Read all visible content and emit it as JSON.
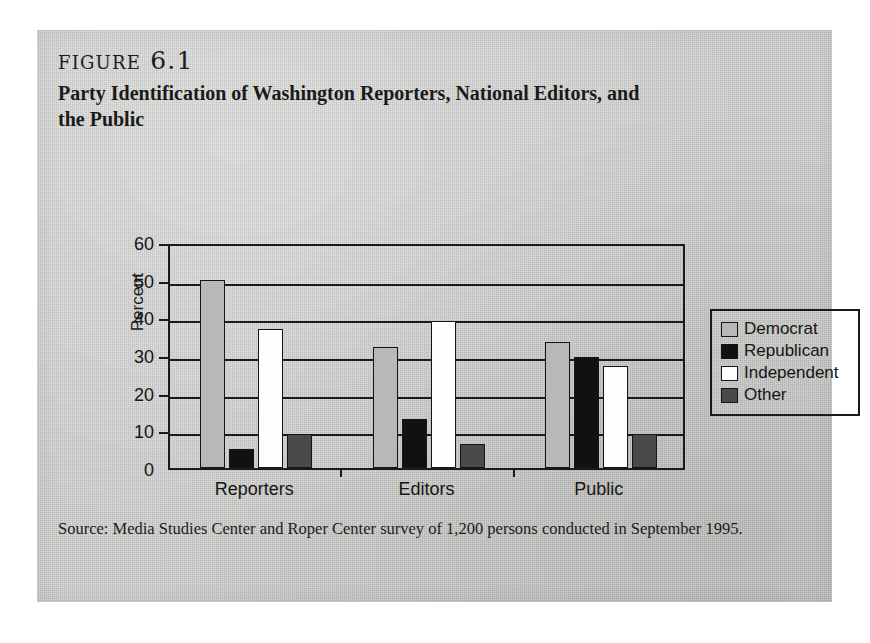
{
  "figure": {
    "number_label": "figure 6.1",
    "caption": "Party Identification of Washington Reporters, National Editors, and the Public",
    "source_note": "Source: Media Studies Center and Roper Center survey of 1,200 persons conducted in September 1995."
  },
  "colors": {
    "page_background": "#ffffff",
    "panel_background": "#c9c9c7",
    "ink": "#1a1a1a",
    "democrat": "#b8b8b6",
    "republican": "#111111",
    "independent": "#fdfdfb",
    "other": "#4a4a4a"
  },
  "chart_data": {
    "type": "bar",
    "title": "Party Identification of Washington Reporters, National Editors, and the Public",
    "xlabel": "",
    "ylabel": "Percent",
    "ylim": [
      0,
      60
    ],
    "yticks": [
      0,
      10,
      20,
      30,
      40,
      50,
      60
    ],
    "grid": true,
    "legend_position": "right",
    "categories": [
      "Reporters",
      "Editors",
      "Public"
    ],
    "series": [
      {
        "name": "Democrat",
        "color": "#b8b8b6",
        "values": [
          50,
          32,
          33.5
        ]
      },
      {
        "name": "Republican",
        "color": "#111111",
        "values": [
          5,
          13,
          29.5
        ]
      },
      {
        "name": "Independent",
        "color": "#fdfdfb",
        "values": [
          37,
          39,
          27
        ]
      },
      {
        "name": "Other",
        "color": "#4a4a4a",
        "values": [
          9,
          6.5,
          9
        ]
      }
    ]
  }
}
